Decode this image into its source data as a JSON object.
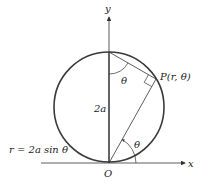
{
  "diagram": {
    "axes": {
      "x_label": "x",
      "y_label": "y",
      "origin_label": "O"
    },
    "point_label": "P(r,  θ)",
    "diameter_label": "2a",
    "angle_top_label": "θ",
    "angle_bottom_label": "θ",
    "equation_label": "r = 2a  sin  θ",
    "colors": {
      "stroke": "#333333",
      "circle": "#3a3a3a"
    }
  }
}
